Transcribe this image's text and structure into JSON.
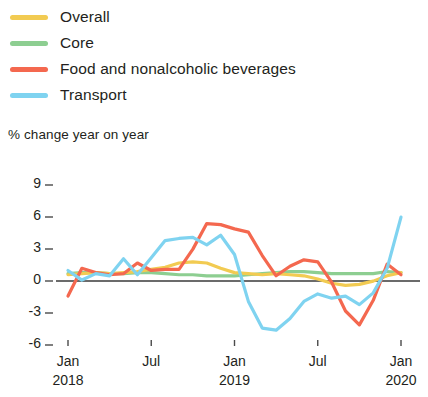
{
  "legend": {
    "items": [
      {
        "label": "Overall",
        "color": "#F2CB52",
        "icon": "line-swatch"
      },
      {
        "label": "Core",
        "color": "#8DCE91",
        "icon": "line-swatch"
      },
      {
        "label": "Food and nonalcoholic beverages",
        "color": "#F4684F",
        "icon": "line-swatch"
      },
      {
        "label": "Transport",
        "color": "#7FD3F0",
        "icon": "line-swatch"
      }
    ]
  },
  "axis": {
    "y_title": "% change year on year",
    "y_ticks": [
      "9",
      "6",
      "3",
      "0",
      "-3",
      "-6"
    ],
    "x_ticks": [
      {
        "month": "Jan",
        "year": "2018"
      },
      {
        "month": "Jul",
        "year": ""
      },
      {
        "month": "Jan",
        "year": "2019"
      },
      {
        "month": "Jul",
        "year": ""
      },
      {
        "month": "Jan",
        "year": "2020"
      }
    ]
  },
  "chart_data": {
    "type": "line",
    "title": "",
    "subtitle": "",
    "xlabel": "",
    "ylabel": "% change year on year",
    "ylim": [
      -7.5,
      9.5
    ],
    "yticks": [
      9,
      6,
      3,
      0,
      -3,
      -6
    ],
    "grid": false,
    "legend_position": "top-left",
    "zero_line": true,
    "x": [
      "2018-01",
      "2018-02",
      "2018-03",
      "2018-04",
      "2018-05",
      "2018-06",
      "2018-07",
      "2018-08",
      "2018-09",
      "2018-10",
      "2018-11",
      "2018-12",
      "2019-01",
      "2019-02",
      "2019-03",
      "2019-04",
      "2019-05",
      "2019-06",
      "2019-07",
      "2019-08",
      "2019-09",
      "2019-10",
      "2019-11",
      "2019-12",
      "2020-01"
    ],
    "xtick_labels": [
      "Jan 2018",
      "Jul",
      "Jan 2019",
      "Jul",
      "Jan 2020"
    ],
    "xtick_indices": [
      0,
      6,
      12,
      18,
      24
    ],
    "series": [
      {
        "name": "Overall",
        "color": "#F2CB52",
        "values": [
          0.4,
          0.5,
          0.6,
          0.5,
          0.6,
          0.7,
          0.9,
          1.1,
          1.5,
          1.6,
          1.5,
          1.0,
          0.6,
          0.5,
          0.4,
          0.5,
          0.4,
          0.3,
          0.0,
          -0.4,
          -0.6,
          -0.5,
          -0.2,
          0.3,
          0.6
        ]
      },
      {
        "name": "Core",
        "color": "#8DCE91",
        "values": [
          0.5,
          0.6,
          0.6,
          0.5,
          0.5,
          0.6,
          0.6,
          0.5,
          0.4,
          0.4,
          0.3,
          0.3,
          0.3,
          0.4,
          0.5,
          0.6,
          0.7,
          0.7,
          0.6,
          0.5,
          0.5,
          0.5,
          0.5,
          0.7,
          0.6
        ]
      },
      {
        "name": "Food and nonalcoholic beverages",
        "color": "#F4684F",
        "values": [
          -1.6,
          1.0,
          0.6,
          0.4,
          0.5,
          1.5,
          0.8,
          0.9,
          0.9,
          2.8,
          5.2,
          5.1,
          4.7,
          4.4,
          2.2,
          0.3,
          1.2,
          1.8,
          1.6,
          -0.3,
          -3.0,
          -4.3,
          -2.0,
          1.4,
          0.4
        ]
      },
      {
        "name": "Transport",
        "color": "#7FD3F0",
        "values": [
          0.8,
          -0.1,
          0.5,
          0.3,
          1.9,
          0.4,
          2.0,
          3.6,
          3.8,
          3.9,
          3.2,
          4.1,
          2.3,
          -2.1,
          -4.6,
          -4.8,
          -3.7,
          -2.1,
          -1.4,
          -1.8,
          -1.6,
          -2.4,
          -1.3,
          1.0,
          5.8
        ]
      }
    ]
  }
}
